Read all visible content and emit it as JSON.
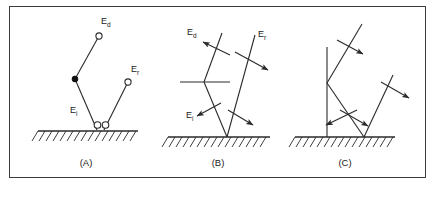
{
  "figure": {
    "background_color": "#ffffff",
    "line_color": "#2a2a2a",
    "border_color": "#3a3a3a",
    "panels": [
      {
        "id": "A",
        "caption": "(A)",
        "labels": [
          {
            "name": "E-d",
            "base": "E",
            "sub": "d"
          },
          {
            "name": "E-r",
            "base": "E",
            "sub": "r"
          },
          {
            "name": "E-i",
            "base": "E",
            "sub": "i"
          }
        ],
        "markers": [
          "open-circle-ed",
          "filled-dot-bend",
          "open-circle-er",
          "open-circle-vertex-left",
          "open-circle-vertex-right"
        ],
        "description": "Ray paths terminated with circle and dot markers above hatched ground"
      },
      {
        "id": "B",
        "caption": "(B)",
        "labels": [
          {
            "name": "E-d",
            "base": "E",
            "sub": "d"
          },
          {
            "name": "E-r",
            "base": "E",
            "sub": "r"
          },
          {
            "name": "E-i",
            "base": "E",
            "sub": "i"
          }
        ],
        "markers": [
          "transverse-arrow-ed",
          "transverse-arrow-er",
          "transverse-arrow-ei",
          "transverse-arrow-reflected",
          "horizontal-interface-bar"
        ],
        "description": "Ray paths with transverse polarization arrows above hatched ground"
      },
      {
        "id": "C",
        "caption": "(C)",
        "labels": [],
        "markers": [
          "transverse-arrow-upper",
          "transverse-arrow-lower-left",
          "transverse-arrow-lower-right",
          "transverse-arrow-right",
          "vertical-line"
        ],
        "description": "Ray paths with transverse arrows and vertical line above hatched ground"
      }
    ]
  }
}
